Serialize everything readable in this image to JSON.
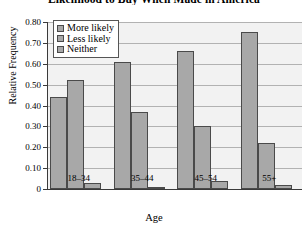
{
  "chart_data": {
    "type": "bar",
    "title": "Likelihood to Buy When Made in America",
    "xlabel": "Age",
    "ylabel": "Relative Frequency",
    "categories": [
      "18–34",
      "35–44",
      "45–54",
      "55+"
    ],
    "series": [
      {
        "name": "More likely",
        "values": [
          0.44,
          0.61,
          0.66,
          0.75
        ]
      },
      {
        "name": "Less likely",
        "values": [
          0.52,
          0.37,
          0.3,
          0.22
        ]
      },
      {
        "name": "Neither",
        "values": [
          0.03,
          0.01,
          0.04,
          0.02
        ]
      }
    ],
    "ylim": [
      0,
      0.8
    ],
    "ytick_values": [
      0,
      0.1,
      0.2,
      0.3,
      0.4,
      0.5,
      0.6,
      0.7,
      0.8
    ],
    "ytick_labels": [
      "0",
      "0.10",
      "0.20",
      "0.30",
      "0.40",
      "0.50",
      "0.60",
      "0.70",
      "0.80"
    ],
    "grid": true,
    "legend_position": "top-left-inside",
    "bar_fill_color": "#a8a8a8",
    "bar_edge_color": "#4a4a4a",
    "plot_background_color": "#f2f2f2",
    "gridline_color": "#b2b2b2"
  }
}
